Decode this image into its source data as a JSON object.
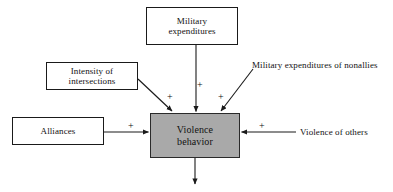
{
  "diagram": {
    "colors": {
      "center_box_fill": "#a9a9a9",
      "box_border": "#1a1a1a",
      "text": "#111111",
      "background": "#ffffff"
    },
    "nodes": [
      {
        "id": "military-expenditures",
        "line1": "Military",
        "line2": "expenditures",
        "boxed": true
      },
      {
        "id": "intensity",
        "line1": "Intensity of",
        "line2": "intersections",
        "boxed": true
      },
      {
        "id": "alliances",
        "line1": "Alliances",
        "line2": "",
        "boxed": true
      },
      {
        "id": "violence-behavior",
        "line1": "Violence",
        "line2": "behavior",
        "boxed": true,
        "highlighted": true
      },
      {
        "id": "military-expenditures-nonallies",
        "line1": "Military expenditures",
        "line2": "of nonallies",
        "boxed": false
      },
      {
        "id": "violence-of-others",
        "line1": "Violence of others",
        "line2": "",
        "boxed": false
      }
    ],
    "edges": [
      {
        "id": "military-to-violence",
        "from": "military-expenditures",
        "to": "violence-behavior",
        "sign": "+"
      },
      {
        "id": "intensity-to-violence",
        "from": "intensity",
        "to": "violence-behavior",
        "sign": "+"
      },
      {
        "id": "nonallies-to-violence",
        "from": "military-expenditures-nonallies",
        "to": "violence-behavior",
        "sign": "+"
      },
      {
        "id": "alliances-to-violence",
        "from": "alliances",
        "to": "violence-behavior",
        "sign": "+"
      },
      {
        "id": "others-to-violence",
        "from": "violence-of-others",
        "to": "violence-behavior",
        "sign": "+"
      },
      {
        "id": "violence-output",
        "from": "violence-behavior",
        "to": "",
        "sign": ""
      }
    ],
    "signs": {
      "plus": "+"
    }
  }
}
